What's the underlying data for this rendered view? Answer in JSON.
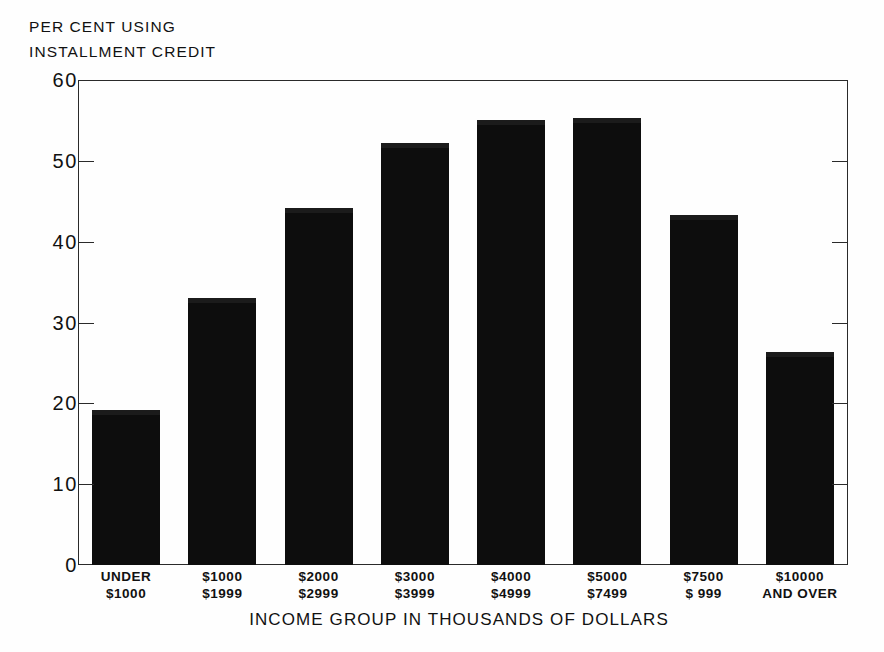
{
  "chart_data": {
    "type": "bar",
    "title": "",
    "subtitle": "",
    "ylabel_lines": [
      "PER CENT USING",
      "INSTALLMENT CREDIT"
    ],
    "xlabel": "INCOME GROUP IN THOUSANDS OF DOLLARS",
    "ylim": [
      0,
      60
    ],
    "yticks": [
      0,
      10,
      20,
      30,
      40,
      50,
      60
    ],
    "ytick_labels": [
      "0",
      "10",
      "20",
      "30",
      "40",
      "50",
      "60"
    ],
    "grid": false,
    "legend": false,
    "bar_color": "#0d0d0d",
    "categories": [
      "UNDER $1000",
      "$1000 $1999",
      "$2000 $2999",
      "$3000 $3999",
      "$4000 $4999",
      "$5000 $7499",
      "$7500 $ 999",
      "$10000 AND OVER"
    ],
    "category_lines": [
      [
        "UNDER",
        "$1000"
      ],
      [
        "$1000",
        "$1999"
      ],
      [
        "$2000",
        "$2999"
      ],
      [
        "$3000",
        "$3999"
      ],
      [
        "$4000",
        "$4999"
      ],
      [
        "$5000",
        "$7499"
      ],
      [
        "$7500",
        "$ 999"
      ],
      [
        "$10000",
        "AND OVER"
      ]
    ],
    "values": [
      19.2,
      33,
      44.2,
      52.2,
      55.1,
      55.3,
      43.3,
      26.4
    ]
  }
}
